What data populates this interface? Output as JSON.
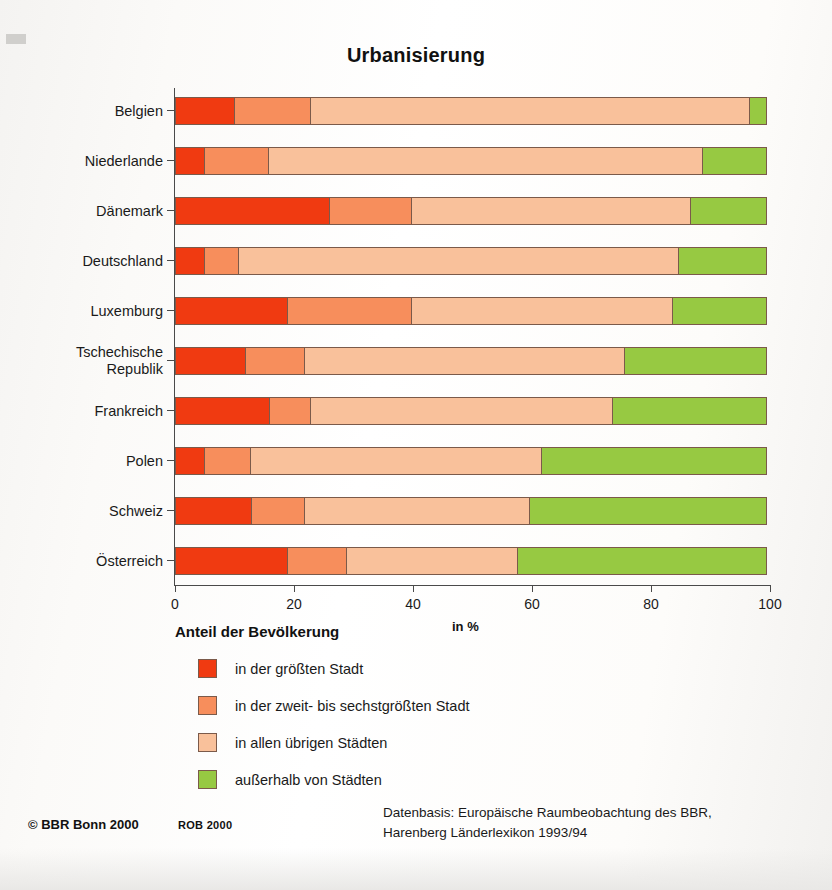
{
  "title": "Urbanisierung",
  "axis": {
    "caption": "Anteil der Bevölkerung",
    "unit": "in %",
    "ticks": [
      0,
      20,
      40,
      60,
      80,
      100
    ],
    "tick_labels": [
      "0",
      "20",
      "40",
      "60",
      "80",
      "100"
    ]
  },
  "legend": {
    "items": [
      {
        "label": "in der größten Stadt",
        "color": "#F03A11"
      },
      {
        "label": "in der zweit- bis sechstgrößten Stadt",
        "color": "#F78E5C"
      },
      {
        "label": "in allen übrigen Städten",
        "color": "#F9C19B"
      },
      {
        "label": "außerhalb von Städten",
        "color": "#97C942"
      }
    ]
  },
  "footer": {
    "credit": "© BBR Bonn 2000",
    "rob": "ROB 2000",
    "source": "Datenbasis: Europäische Raumbeobachtung des BBR,\nHarenberg Länderlexikon 1993/94"
  },
  "chart_data": {
    "type": "bar",
    "orientation": "horizontal",
    "stacked": true,
    "stack_total": 100,
    "title": "Urbanisierung",
    "xlabel": "in %",
    "ylabel": "Anteil der Bevölkerung",
    "xlim": [
      0,
      100
    ],
    "xticks": [
      0,
      20,
      40,
      60,
      80,
      100
    ],
    "grid": false,
    "legend_position": "below-left",
    "categories": [
      "Belgien",
      "Niederlande",
      "Dänemark",
      "Deutschland",
      "Luxemburg",
      "Tschechische\nRepublik",
      "Frankreich",
      "Polen",
      "Schweiz",
      "Österreich"
    ],
    "series": [
      {
        "name": "in der größten Stadt",
        "color": "#F03A11",
        "values": [
          10,
          5,
          26,
          5,
          19,
          12,
          16,
          5,
          13,
          19
        ]
      },
      {
        "name": "in der zweit- bis sechstgrößten Stadt",
        "color": "#F78E5C",
        "values": [
          13,
          11,
          14,
          6,
          21,
          10,
          7,
          8,
          9,
          10
        ]
      },
      {
        "name": "in allen übrigen Städten",
        "color": "#F9C19B",
        "values": [
          74,
          73,
          47,
          74,
          44,
          54,
          51,
          49,
          38,
          29
        ]
      },
      {
        "name": "außerhalb von Städten",
        "color": "#97C942",
        "values": [
          3,
          11,
          13,
          15,
          16,
          24,
          26,
          38,
          40,
          42
        ]
      }
    ]
  }
}
